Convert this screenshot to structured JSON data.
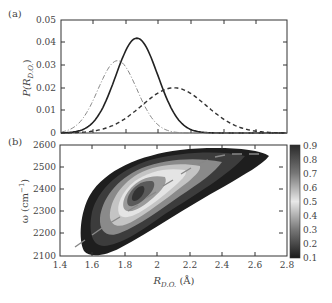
{
  "chart_data": [
    {
      "panel": "(a)",
      "type": "line",
      "title": "",
      "xlabel": "",
      "ylabel": "P(R_D.O.)",
      "xlim": [
        1.4,
        2.8
      ],
      "ylim": [
        0,
        0.05
      ],
      "yticks": [
        "0",
        "0.01",
        "0.02",
        "0.03",
        "0.04",
        "0.05"
      ],
      "grid": false,
      "series": [
        {
          "name": "solid",
          "style": "solid",
          "peak_x": 1.87,
          "peak_y": 0.042,
          "sigma": 0.13
        },
        {
          "name": "dash-dot",
          "style": "dashdot",
          "peak_x": 1.75,
          "peak_y": 0.032,
          "sigma": 0.12
        },
        {
          "name": "dashed",
          "style": "dashed",
          "peak_x": 2.1,
          "peak_y": 0.02,
          "sigma": 0.2
        }
      ]
    },
    {
      "panel": "(b)",
      "type": "heatmap",
      "subtype": "filled contour",
      "xlabel": "R_D.O. (Å)",
      "ylabel": "ω (cm⁻¹)",
      "xlim": [
        1.4,
        2.8
      ],
      "ylim": [
        2100,
        2600
      ],
      "xticks": [
        "1.4",
        "1.6",
        "1.8",
        "2",
        "2.2",
        "2.4",
        "2.6",
        "2.8"
      ],
      "yticks": [
        "2100",
        "2200",
        "2300",
        "2400",
        "2500",
        "2600"
      ],
      "colorbar_ticks": [
        "0.1",
        "0.2",
        "0.3",
        "0.4",
        "0.5",
        "0.6",
        "0.7",
        "0.8",
        "0.9"
      ],
      "peak": {
        "x": 1.83,
        "y": 2350
      },
      "dashed_ridge": [
        [
          1.5,
          2220
        ],
        [
          1.8,
          2350
        ],
        [
          2.2,
          2480
        ],
        [
          2.7,
          2545
        ]
      ]
    }
  ],
  "labels": {
    "panel_a": "(a)",
    "panel_b": "(b)",
    "a_ylabel_main": "P(R",
    "a_ylabel_sub": "D.O.",
    "a_ylabel_end": ")",
    "b_ylabel": "ω (cm",
    "b_ylabel_sup": "−1",
    "b_ylabel_end": ")",
    "b_xlabel_main": "R",
    "b_xlabel_sub": "D.O.",
    "b_xlabel_end": " (Å)"
  }
}
